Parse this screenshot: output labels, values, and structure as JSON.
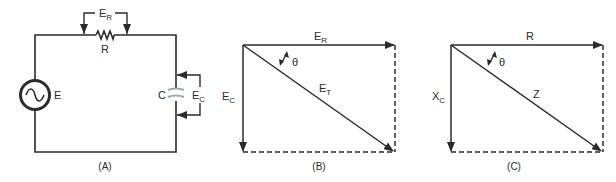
{
  "panel_a": {
    "caption": "(A)",
    "source_label": "E",
    "resistor_label": "R",
    "capacitor_label": "C",
    "resistor_voltage": {
      "main": "E",
      "sub": "R"
    },
    "capacitor_voltage": {
      "main": "E",
      "sub": "C"
    }
  },
  "panel_b": {
    "caption": "(B)",
    "horizontal_vector": {
      "main": "E",
      "sub": "R"
    },
    "vertical_vector": {
      "main": "E",
      "sub": "C"
    },
    "resultant_vector": {
      "main": "E",
      "sub": "T"
    },
    "angle_label": "θ"
  },
  "panel_c": {
    "caption": "(C)",
    "horizontal_vector": {
      "main": "R",
      "sub": ""
    },
    "vertical_vector": {
      "main": "X",
      "sub": "C"
    },
    "resultant_vector": {
      "main": "Z",
      "sub": ""
    },
    "angle_label": "θ"
  },
  "colors": {
    "line": "#2b2b2b",
    "capacitor": "#9aa5ad"
  }
}
